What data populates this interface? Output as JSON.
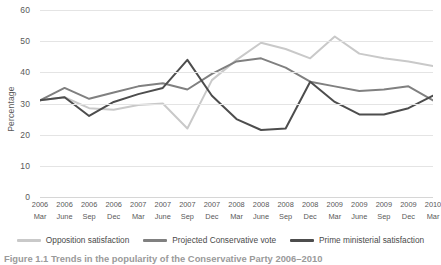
{
  "chart_data": {
    "type": "line",
    "title": "",
    "xlabel": "",
    "ylabel": "Percentage",
    "ylim": [
      0,
      60
    ],
    "yticks": [
      0,
      10,
      20,
      30,
      40,
      50,
      60
    ],
    "grid": true,
    "legend_position": "bottom",
    "categories": [
      "2006 Mar",
      "2006 June",
      "2006 Sep",
      "2006 Dec",
      "2007 Mar",
      "2007 June",
      "2007 Sep",
      "2007 Dec",
      "2008 Mar",
      "2008 June",
      "2008 Sep",
      "2008 Dec",
      "2009 Mar",
      "2009 June",
      "2009 Sep",
      "2009 Dec",
      "2010 Mar"
    ],
    "x_years": [
      "2006",
      "2006",
      "2006",
      "2006",
      "2007",
      "2007",
      "2007",
      "2007",
      "2008",
      "2008",
      "2008",
      "2008",
      "2009",
      "2009",
      "2009",
      "2009",
      "2010"
    ],
    "x_months": [
      "Mar",
      "June",
      "Sep",
      "Dec",
      "Mar",
      "June",
      "Sep",
      "Dec",
      "Mar",
      "June",
      "Sep",
      "Dec",
      "Mar",
      "June",
      "Sep",
      "Dec",
      "Mar"
    ],
    "series": [
      {
        "name": "Opposition satisfaction",
        "color": "#c9c9c9",
        "values": [
          31,
          32,
          28.5,
          28,
          29.5,
          30,
          22,
          37.5,
          44,
          49.5,
          47.5,
          44.5,
          51.5,
          46,
          44.5,
          43.5,
          42
        ]
      },
      {
        "name": "Projected Conservative vote",
        "color": "#808080",
        "values": [
          31,
          35,
          31.5,
          33.5,
          35.5,
          36.5,
          34.5,
          39.5,
          43.5,
          44.5,
          41.5,
          37,
          35.5,
          34,
          34.5,
          35.5,
          31
        ]
      },
      {
        "name": "Prime ministerial satisfaction",
        "color": "#4d4d4d",
        "values": [
          31,
          32,
          26,
          30.5,
          33,
          35,
          44,
          32.5,
          25,
          21.5,
          22,
          37,
          30.5,
          26.5,
          26.5,
          28.5,
          32.5
        ]
      }
    ]
  },
  "caption": {
    "text": "Figure 1.1 Trends in the popularity of the Conservative Party 2006–2010"
  }
}
